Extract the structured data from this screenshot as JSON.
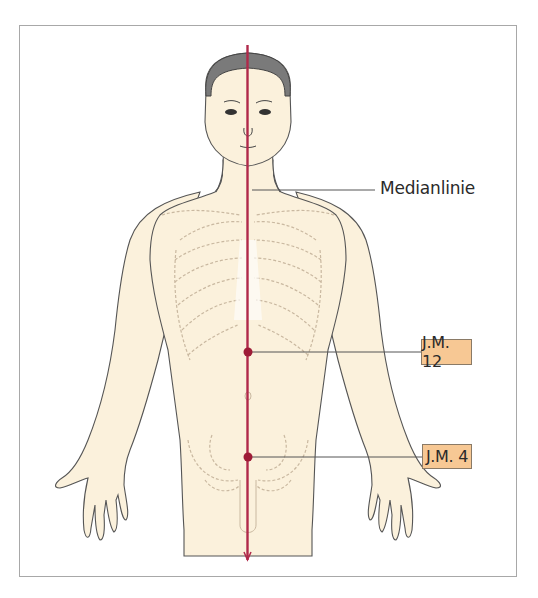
{
  "figure": {
    "colors": {
      "skin": "#fbf1dc",
      "outline": "#555555",
      "hair": "#7a7a7a",
      "meridian": "#b0294a",
      "point": "#9e1c37",
      "label_box": "#f7c894",
      "frame": "#a8a8a8",
      "skeleton_dashes": "#c9b8a0"
    }
  },
  "labels": {
    "median_line": "Medianlinie",
    "points": [
      {
        "id": "jm12",
        "label": "J.M. 12"
      },
      {
        "id": "jm4",
        "label": "J.M. 4"
      }
    ]
  }
}
